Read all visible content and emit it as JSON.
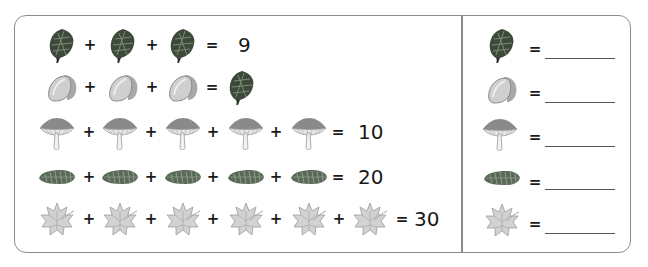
{
  "puzzle": {
    "rows": [
      {
        "items": [
          "pinecone",
          "pinecone",
          "pinecone"
        ],
        "operator": "+",
        "equals": "=",
        "result": "9",
        "result_type": "number"
      },
      {
        "items": [
          "acorn",
          "acorn",
          "acorn"
        ],
        "operator": "+",
        "equals": "=",
        "result": "pinecone",
        "result_type": "icon"
      },
      {
        "items": [
          "mushroom",
          "mushroom",
          "mushroom",
          "mushroom",
          "mushroom"
        ],
        "operator": "+",
        "equals": "=",
        "result": "10",
        "result_type": "number"
      },
      {
        "items": [
          "spruce-cone",
          "spruce-cone",
          "spruce-cone",
          "spruce-cone",
          "spruce-cone"
        ],
        "operator": "+",
        "equals": "=",
        "result": "20",
        "result_type": "number"
      },
      {
        "items": [
          "maple-leaf",
          "maple-leaf",
          "maple-leaf",
          "maple-leaf",
          "maple-leaf",
          "maple-leaf"
        ],
        "operator": "+",
        "equals": "=",
        "result": "30",
        "result_type": "number"
      }
    ],
    "row1_result": "9",
    "row3_result": "10",
    "row4_result": "20",
    "row5_result": "30"
  },
  "answers": {
    "equals": "=",
    "items": [
      {
        "icon": "pinecone",
        "value": ""
      },
      {
        "icon": "acorn",
        "value": ""
      },
      {
        "icon": "mushroom",
        "value": ""
      },
      {
        "icon": "spruce-cone",
        "value": ""
      },
      {
        "icon": "maple-leaf",
        "value": ""
      }
    ]
  },
  "symbols": {
    "plus": "+",
    "equals": "="
  },
  "colors": {
    "border": "#8c8c8c",
    "text": "#1a1a1a",
    "pinecone": "#3d4a3a",
    "acorn": "#b8b8b8",
    "leaf": "#cfcfcf"
  }
}
